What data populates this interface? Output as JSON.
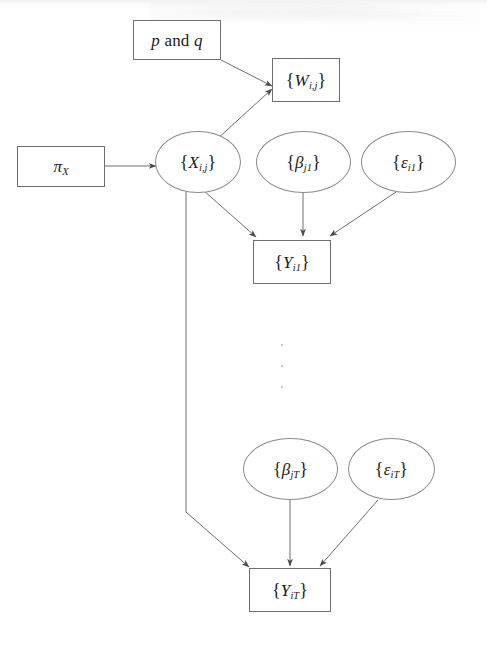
{
  "figure": {
    "kind": "directed-acyclic-graph",
    "background_color": "#ffffff",
    "stroke_color": "#6e6e6e",
    "text_color": "#1b1b1b",
    "width": 487,
    "height": 646
  },
  "nodes": {
    "pq": {
      "id": "p-and-q",
      "shape": "rectangle",
      "text": "p and q",
      "symbol": "p",
      "conjunction": "and",
      "symbol2": "q"
    },
    "w": {
      "id": "W-ij",
      "shape": "rectangle",
      "text": "{W i,j}",
      "base": "W",
      "subscript": "i,j"
    },
    "pix": {
      "id": "pi-X",
      "shape": "rectangle",
      "text": "π X",
      "base": "π",
      "subscript": "X"
    },
    "x": {
      "id": "X-ij",
      "shape": "ellipse",
      "text": "{X i,j}",
      "base": "X",
      "subscript": "i,j"
    },
    "beta1": {
      "id": "beta-j1",
      "shape": "ellipse",
      "text": "{β j1}",
      "base": "β",
      "subscript": "j1"
    },
    "eps1": {
      "id": "epsilon-i1",
      "shape": "ellipse",
      "text": "{ε i1}",
      "base": "ε",
      "subscript": "i1"
    },
    "y1": {
      "id": "Y-i1",
      "shape": "rectangle",
      "text": "{Y i1}",
      "base": "Y",
      "subscript": "i1"
    },
    "betaT": {
      "id": "beta-jT",
      "shape": "ellipse",
      "text": "{β jT}",
      "base": "β",
      "subscript": "jT"
    },
    "epsT": {
      "id": "epsilon-iT",
      "shape": "ellipse",
      "text": "{ε iT}",
      "base": "ε",
      "subscript": "iT"
    },
    "yT": {
      "id": "Y-iT",
      "shape": "rectangle",
      "text": "{Y iT}",
      "base": "Y",
      "subscript": "iT"
    }
  },
  "edges": [
    {
      "from": "p-and-q",
      "to": "W-ij",
      "arrowhead": true
    },
    {
      "from": "X-ij",
      "to": "W-ij",
      "arrowhead": true
    },
    {
      "from": "pi-X",
      "to": "X-ij",
      "arrowhead": true
    },
    {
      "from": "X-ij",
      "to": "Y-i1",
      "arrowhead": true
    },
    {
      "from": "beta-j1",
      "to": "Y-i1",
      "arrowhead": true
    },
    {
      "from": "epsilon-i1",
      "to": "Y-i1",
      "arrowhead": true
    },
    {
      "from": "X-ij",
      "to": "Y-iT",
      "arrowhead": true,
      "routing": "elbow"
    },
    {
      "from": "beta-jT",
      "to": "Y-iT",
      "arrowhead": true
    },
    {
      "from": "epsilon-iT",
      "to": "Y-iT",
      "arrowhead": true
    }
  ],
  "ellipsis": {
    "label": "vertical-ellipsis",
    "dots": 3
  }
}
